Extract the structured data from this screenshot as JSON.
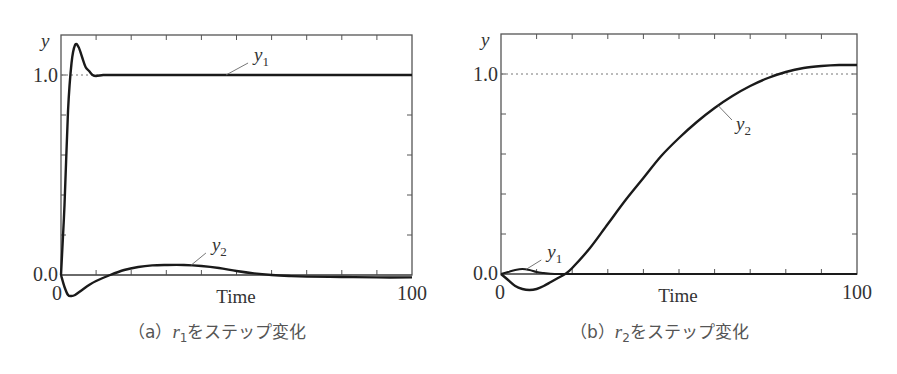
{
  "figure": {
    "captions": [
      {
        "label": "（a）",
        "var": "r",
        "sub": "1",
        "text": "をステップ変化"
      },
      {
        "label": "（b）",
        "var": "r",
        "sub": "2",
        "text": "をステップ変化"
      }
    ]
  },
  "chart_data": [
    {
      "type": "line",
      "title": "(a) r1をステップ変化",
      "xlabel": "Time",
      "ylabel": "y",
      "xlim": [
        0,
        100
      ],
      "ylim": [
        -0.13,
        1.25
      ],
      "x_tick_labels": [
        "0",
        "100"
      ],
      "y_tick_labels": [
        "0.0",
        "1.0"
      ],
      "reference_line": {
        "y": 1.0,
        "style": "dotted"
      },
      "grid": false,
      "series": [
        {
          "name": "y1",
          "x": [
            0,
            1,
            2,
            3,
            4,
            5,
            6,
            7,
            8,
            9,
            10,
            12,
            14,
            16,
            20,
            30,
            50,
            100
          ],
          "y": [
            0,
            0.35,
            0.82,
            1.06,
            1.15,
            1.14,
            1.09,
            1.04,
            1.02,
            1.0,
            0.995,
            1.0,
            1.0,
            1.0,
            1.0,
            1.0,
            1.0,
            1.0
          ]
        },
        {
          "name": "y2",
          "x": [
            0,
            1,
            2,
            3,
            4,
            6,
            8,
            10,
            14,
            18,
            22,
            26,
            30,
            35,
            40,
            45,
            50,
            55,
            60,
            65,
            70,
            80,
            90,
            100
          ],
          "y": [
            0,
            -0.06,
            -0.1,
            -0.105,
            -0.1,
            -0.075,
            -0.05,
            -0.03,
            0.0,
            0.025,
            0.04,
            0.048,
            0.05,
            0.05,
            0.045,
            0.035,
            0.02,
            0.008,
            0.0,
            -0.005,
            -0.008,
            -0.01,
            -0.012,
            -0.012
          ]
        }
      ],
      "annotations": [
        {
          "text": "y1",
          "x": 55,
          "y": 1.07
        },
        {
          "text": "y2",
          "x": 43,
          "y": 0.12
        }
      ]
    },
    {
      "type": "line",
      "title": "(b) r2をステップ変化",
      "xlabel": "Time",
      "ylabel": "y",
      "xlim": [
        0,
        100
      ],
      "ylim": [
        -0.13,
        1.25
      ],
      "x_tick_labels": [
        "0",
        "100"
      ],
      "y_tick_labels": [
        "0.0",
        "1.0"
      ],
      "reference_line": {
        "y": 1.0,
        "style": "dotted"
      },
      "grid": false,
      "series": [
        {
          "name": "y1",
          "x": [
            0,
            2,
            4,
            6,
            8,
            10,
            12,
            15,
            20,
            30,
            50,
            100
          ],
          "y": [
            0,
            0.01,
            0.02,
            0.025,
            0.02,
            0.01,
            0.005,
            0.0,
            0.0,
            0.0,
            0.0,
            0.0
          ]
        },
        {
          "name": "y2",
          "x": [
            0,
            2,
            4,
            6,
            8,
            10,
            12,
            14,
            16,
            18,
            20,
            25,
            30,
            35,
            40,
            45,
            50,
            55,
            60,
            65,
            70,
            75,
            80,
            85,
            90,
            95,
            100
          ],
          "y": [
            0,
            -0.03,
            -0.06,
            -0.075,
            -0.08,
            -0.075,
            -0.06,
            -0.04,
            -0.02,
            0.0,
            0.03,
            0.13,
            0.25,
            0.37,
            0.48,
            0.59,
            0.68,
            0.76,
            0.83,
            0.89,
            0.94,
            0.98,
            1.01,
            1.03,
            1.04,
            1.045,
            1.045
          ]
        }
      ],
      "annotations": [
        {
          "text": "y1",
          "x": 13,
          "y": 0.08
        },
        {
          "text": "y2",
          "x": 66,
          "y": 0.72
        }
      ]
    }
  ]
}
